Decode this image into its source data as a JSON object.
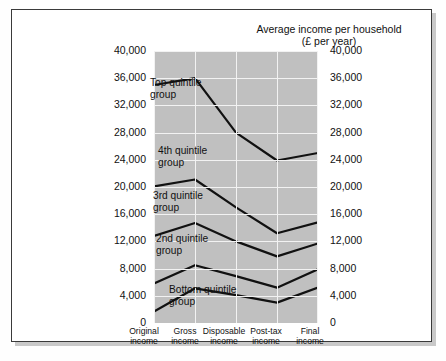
{
  "chart_data": {
    "type": "line",
    "title": "Average income per household",
    "subtitle": "(£ per year)",
    "xlabel": "",
    "ylabel": "",
    "ylim": [
      0,
      40000
    ],
    "ytick_labels": [
      "40,000",
      "36,000",
      "32,000",
      "28,000",
      "24,000",
      "20,000",
      "16,000",
      "12,000",
      "8,000",
      "4,000",
      "0"
    ],
    "ytick_values": [
      40000,
      36000,
      32000,
      28000,
      24000,
      20000,
      16000,
      12000,
      8000,
      4000,
      0
    ],
    "dual_axis": true,
    "grid": true,
    "legend_position": "inline-labels",
    "categories": [
      "Original income",
      "Gross income",
      "Disposable income",
      "Post-tax income",
      "Final income"
    ],
    "category_lines": [
      [
        "Original",
        "income"
      ],
      [
        "Gross",
        "income"
      ],
      [
        "Disposable",
        "income"
      ],
      [
        "Post-tax",
        "income"
      ],
      [
        "Final",
        "income"
      ]
    ],
    "series": [
      {
        "name": "Top quintile group",
        "values": [
          35000,
          36000,
          28000,
          23900,
          25000
        ]
      },
      {
        "name": "4th quintile group",
        "values": [
          20100,
          21100,
          17000,
          13200,
          14800
        ]
      },
      {
        "name": "3rd quintile group",
        "values": [
          12800,
          14700,
          12000,
          9800,
          11700
        ]
      },
      {
        "name": "2nd quintile group",
        "values": [
          5800,
          8500,
          6900,
          5200,
          7900
        ]
      },
      {
        "name": "Bottom quintile group",
        "values": [
          1700,
          5100,
          4100,
          3000,
          5200
        ]
      }
    ],
    "series_labels": [
      {
        "text_line1": "Top quintile",
        "text_line2": "group"
      },
      {
        "text_line1": "4th quintile",
        "text_line2": "group"
      },
      {
        "text_line1": "3rd quintile",
        "text_line2": "group"
      },
      {
        "text_line1": "2nd quintile",
        "text_line2": "group"
      },
      {
        "text_line1": "Bottom quintile",
        "text_line2": "group"
      }
    ],
    "colors": {
      "plot_background": "#c0c0c0",
      "grid": "#f2f2f2",
      "line": "#111111",
      "card_background": "#ffffff",
      "border": "#3a3a3a",
      "text": "#111111"
    }
  }
}
